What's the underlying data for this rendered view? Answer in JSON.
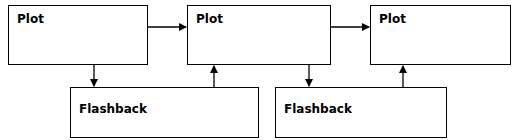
{
  "diagram": {
    "nodes": [
      {
        "id": "plot1",
        "label": "Plot",
        "type": "plot"
      },
      {
        "id": "plot2",
        "label": "Plot",
        "type": "plot"
      },
      {
        "id": "plot3",
        "label": "Plot",
        "type": "plot"
      },
      {
        "id": "flashback1",
        "label": "Flashback",
        "type": "flashback"
      },
      {
        "id": "flashback2",
        "label": "Flashback",
        "type": "flashback"
      }
    ],
    "edges": [
      {
        "from": "plot1",
        "to": "plot2"
      },
      {
        "from": "plot2",
        "to": "plot3"
      },
      {
        "from": "plot1",
        "to": "flashback1"
      },
      {
        "from": "flashback1",
        "to": "plot2"
      },
      {
        "from": "plot2",
        "to": "flashback2"
      },
      {
        "from": "flashback2",
        "to": "plot3"
      }
    ],
    "colors": {
      "stroke": "#000000",
      "fill": "#ffffff",
      "text": "#000000"
    }
  }
}
